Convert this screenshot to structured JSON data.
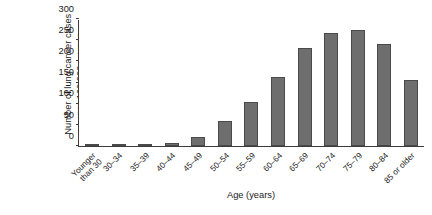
{
  "chart_data": {
    "type": "bar",
    "title": "",
    "xlabel": "Age (years)",
    "ylabel": "Number of lung cancer cases per 100,000 women",
    "ylabel_line1": "Number of lung cancer cases",
    "ylabel_line2": "per 100,000 women",
    "categories": [
      "Younger than 30",
      "30–34",
      "35–39",
      "40–44",
      "45–49",
      "50–54",
      "55–59",
      "60–64",
      "65–69",
      "70–74",
      "75–79",
      "80–84",
      "85 or older"
    ],
    "category_lines": [
      [
        "Younger",
        "than 30"
      ],
      [
        "30–34",
        ""
      ],
      [
        "35–39",
        ""
      ],
      [
        "40–44",
        ""
      ],
      [
        "45–49",
        ""
      ],
      [
        "50–54",
        ""
      ],
      [
        "55–59",
        ""
      ],
      [
        "60–64",
        ""
      ],
      [
        "65–69",
        ""
      ],
      [
        "70–74",
        ""
      ],
      [
        "75–79",
        ""
      ],
      [
        "80–84",
        ""
      ],
      [
        "85 or older",
        ""
      ]
    ],
    "values": [
      0.5,
      1,
      3,
      6,
      22,
      58,
      103,
      162,
      232,
      267,
      275,
      240,
      155
    ],
    "ylim": [
      0,
      300
    ],
    "yticks": [
      0,
      50,
      100,
      150,
      200,
      250,
      300
    ],
    "ytick_labels": [
      "0",
      "50",
      "100",
      "150",
      "200",
      "250",
      "300"
    ],
    "grid": false,
    "legend": "none",
    "bar_color": "#6e6e6e",
    "bar_edge_color": "#4a4a4a",
    "axis_color": "#3c3c3c"
  }
}
